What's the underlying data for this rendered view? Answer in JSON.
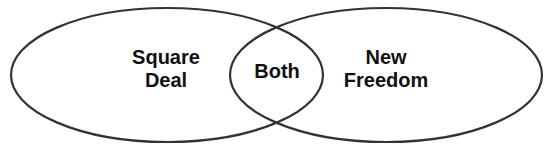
{
  "diagram": {
    "type": "venn",
    "stroke_color": "#333333",
    "background": "#ffffff",
    "sets": [
      {
        "id": "left",
        "lines": [
          "Square",
          "Deal"
        ]
      },
      {
        "id": "right",
        "lines": [
          "New",
          "Freedom"
        ]
      }
    ],
    "intersection": {
      "label": "Both"
    }
  }
}
